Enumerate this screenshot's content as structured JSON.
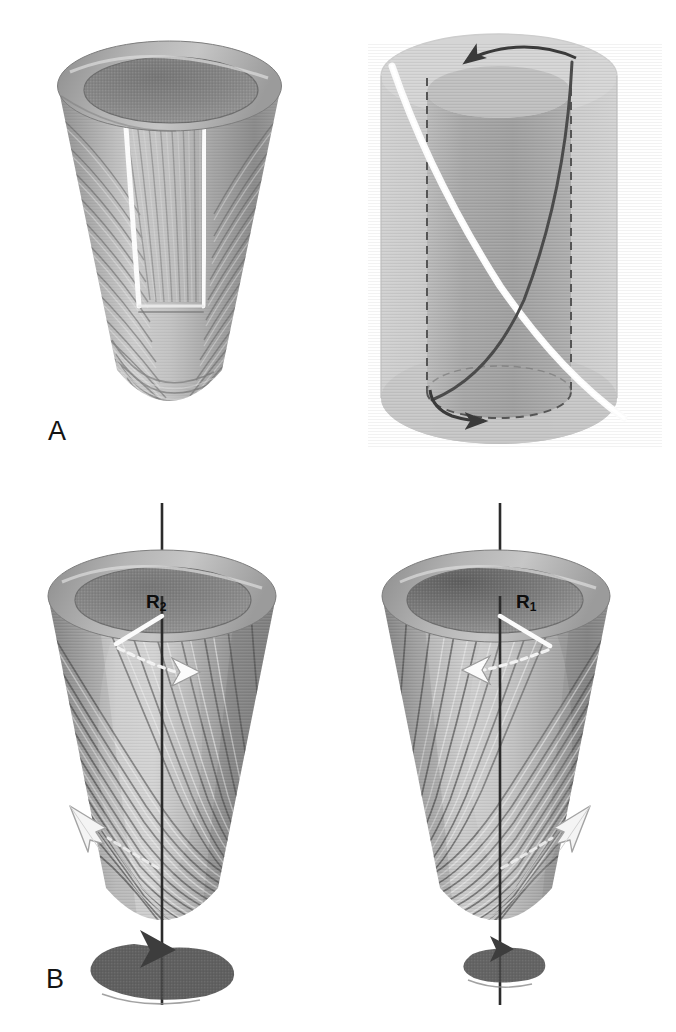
{
  "figure": {
    "kind": "scientific-diagram",
    "background_color": "#ffffff",
    "width": 676,
    "height": 1032
  },
  "panels": [
    {
      "id": "A",
      "label": "A",
      "label_x": 48,
      "label_y": 420,
      "items": [
        {
          "name": "fibered-cone-cutaway",
          "type": "cone",
          "description": "truncated conical ventricle shell with helical myofiber striations and a white-outlined rectangular cut-out patch"
        },
        {
          "name": "unrolled-cylinder",
          "type": "cylinder",
          "description": "transparent cylinder with two crossing helical fiber paths, one white one dark, dashed vertical generators and circumferential arrows"
        }
      ]
    },
    {
      "id": "B",
      "label": "B",
      "label_x": 46,
      "label_y": 968,
      "items": [
        {
          "name": "cone-epicardial",
          "type": "cone",
          "radius_label": "R",
          "radius_subscript": "2",
          "rotation": "large counter-clockwise rotation arrow at apex",
          "surface_arrow": "white outlined fiber-direction arrow pointing up-left at lower-left wall"
        },
        {
          "name": "cone-endocardial",
          "type": "cone",
          "radius_label": "R",
          "radius_subscript": "1",
          "rotation": "small counter-clockwise rotation arrow at apex",
          "surface_arrow": "white outlined fiber-direction arrow pointing up-right at lower-right wall"
        }
      ]
    }
  ],
  "labels": {
    "panel_a": "A",
    "panel_b": "B",
    "radius_outer_base": "R",
    "radius_outer_sub": "2",
    "radius_inner_base": "R",
    "radius_inner_sub": "1"
  },
  "colors": {
    "background": "#ffffff",
    "cone_light": "#d2d2d2",
    "cone_mid": "#a8a8a8",
    "cone_dark": "#7e7e7e",
    "cone_shadow": "#6a6a6a",
    "rim_top": "#9c9c9c",
    "interior": "#8a8a8a",
    "interior_dark": "#6f6f6f",
    "fiber_light": "#e2e2e2",
    "fiber_dark": "#6b6b6b",
    "white_marker": "#fbfbfb",
    "axis_line": "#2b2b2b",
    "arrow_dark": "#3a3a3a",
    "text": "#121212"
  }
}
